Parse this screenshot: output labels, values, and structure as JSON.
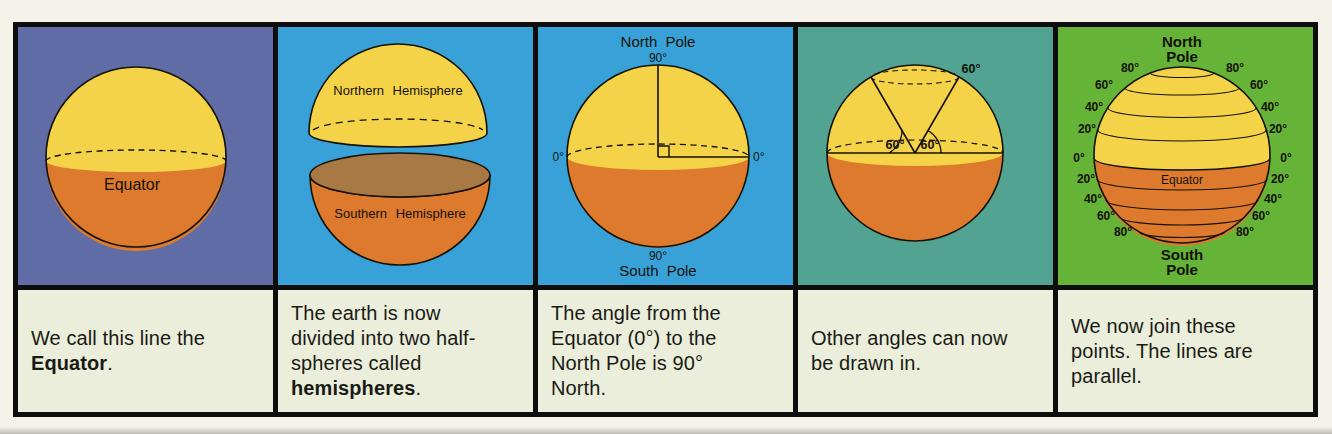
{
  "colors": {
    "frame": "#0d0d0d",
    "outer_bg": "#f4f2e9",
    "caption_bg": "#eaeedb",
    "panel1_bg": "#5f6ca6",
    "panel2_bg": "#38a1d8",
    "panel3_bg": "#38a1d8",
    "panel4_bg": "#53a392",
    "panel5_bg": "#66b437",
    "sphere_yellow": "#f4d348",
    "sphere_orange": "#dd7a2e",
    "bowl_inner": "#a87944",
    "ink": "#141106"
  },
  "panels": [
    {
      "figure": {
        "equator_label": "Equator"
      },
      "caption": {
        "pre": "We call this line the ",
        "bold": "Equator",
        "post": "."
      }
    },
    {
      "figure": {
        "northern_label": "Northern Hemisphere",
        "southern_label": "Southern Hemisphere"
      },
      "caption": {
        "pre": "The earth is now divided into two half-spheres called ",
        "bold": "hemispheres",
        "post": "."
      }
    },
    {
      "figure": {
        "north_pole": "North Pole",
        "top_90": "90°",
        "left_0": "0°",
        "right_0": "0°",
        "bottom_90": "90°",
        "south_pole": "South Pole"
      },
      "caption": {
        "pre": "The angle from the Equator (0°) to the North Pole is 90° North.",
        "bold": "",
        "post": ""
      }
    },
    {
      "figure": {
        "outer_60": "60°",
        "left_60": "60°",
        "right_60": "60°"
      },
      "caption": {
        "pre": "Other angles can now be drawn in.",
        "bold": "",
        "post": ""
      }
    },
    {
      "figure": {
        "north_pole_line1": "North",
        "north_pole_line2": "Pole",
        "south_pole_line1": "South",
        "south_pole_line2": "Pole",
        "equator_label": "Equator",
        "lat_left": [
          "80°",
          "60°",
          "40°",
          "20°",
          "0°",
          "20°",
          "40°",
          "60°",
          "80°"
        ],
        "lat_right": [
          "80°",
          "60°",
          "40°",
          "20°",
          "0°",
          "20°",
          "40°",
          "60°",
          "80°"
        ]
      },
      "caption": {
        "pre": "We now join these points. The lines are parallel.",
        "bold": "",
        "post": ""
      }
    }
  ]
}
